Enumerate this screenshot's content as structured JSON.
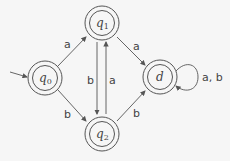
{
  "diagram": {
    "type": "finite-automaton",
    "states": [
      {
        "id": "q0",
        "label": "q",
        "sub": "0",
        "accepting": true,
        "start": true
      },
      {
        "id": "q1",
        "label": "q",
        "sub": "1",
        "accepting": true
      },
      {
        "id": "q2",
        "label": "q",
        "sub": "2",
        "accepting": true
      },
      {
        "id": "d",
        "label": "d",
        "sub": "",
        "accepting": true
      }
    ],
    "transitions": [
      {
        "from": "q0",
        "to": "q1",
        "label": "a"
      },
      {
        "from": "q0",
        "to": "q2",
        "label": "b"
      },
      {
        "from": "q1",
        "to": "q2",
        "label": "b"
      },
      {
        "from": "q2",
        "to": "q1",
        "label": "a"
      },
      {
        "from": "q1",
        "to": "d",
        "label": "a"
      },
      {
        "from": "q2",
        "to": "d",
        "label": "b"
      },
      {
        "from": "d",
        "to": "d",
        "label": "a,b"
      }
    ]
  },
  "labels": {
    "q0_q1": "a",
    "q0_q2": "b",
    "q1_q2": "b",
    "q2_q1": "a",
    "q1_d": "a",
    "q2_d": "b",
    "d_loop": "a, b",
    "q0": "q",
    "q0_sub": "0",
    "q1": "q",
    "q1_sub": "1",
    "q2": "q",
    "q2_sub": "2",
    "d": "d"
  },
  "colors": {
    "stroke": "#555555",
    "background": "#f6f6f6",
    "text": "#444444"
  }
}
